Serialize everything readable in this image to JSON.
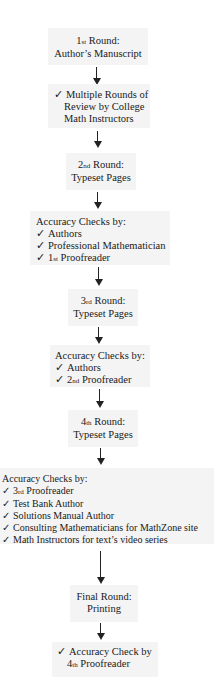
{
  "diagram": {
    "nodes": [
      {
        "id": "round1",
        "lines": [
          {
            "ord_num": "1",
            "ord_sfx": "st",
            "text": " Round:"
          },
          {
            "text": "Author’s Manuscript"
          }
        ]
      },
      {
        "id": "review",
        "lines": [
          {
            "check": "✓",
            "text": "Multiple Rounds of"
          },
          {
            "text": "Review by College"
          },
          {
            "text": "Math Instructors"
          }
        ]
      },
      {
        "id": "round2",
        "lines": [
          {
            "ord_num": "2",
            "ord_sfx": "nd",
            "text": " Round:"
          },
          {
            "text": "Typeset Pages"
          }
        ]
      },
      {
        "id": "checks2",
        "heading": "Accuracy Checks by:",
        "items": [
          "Authors",
          "Professional Mathematician",
          "1st Proofreader"
        ]
      },
      {
        "id": "round3",
        "lines": [
          {
            "ord_num": "3",
            "ord_sfx": "rd",
            "text": " Round:"
          },
          {
            "text": "Typeset Pages"
          }
        ]
      },
      {
        "id": "checks3",
        "heading": "Accuracy Checks by:",
        "items": [
          "Authors",
          "2nd Proofreader"
        ]
      },
      {
        "id": "round4",
        "lines": [
          {
            "ord_num": "4",
            "ord_sfx": "th",
            "text": " Round:"
          },
          {
            "text": "Typeset Pages"
          }
        ]
      },
      {
        "id": "checks4",
        "heading": "Accuracy Checks by:",
        "items": [
          "3rd Proofreader",
          "Test Bank Author",
          "Solutions Manual Author",
          "Consulting Mathematicians for MathZone site",
          "Math Instructors for text’s video series"
        ]
      },
      {
        "id": "final",
        "lines": [
          {
            "text": "Final Round:"
          },
          {
            "text": "Printing"
          }
        ]
      },
      {
        "id": "check_final",
        "lines": [
          {
            "check": "✓",
            "text": "Accuracy Check by"
          },
          {
            "text": "4th Proofreader"
          }
        ]
      }
    ],
    "check_glyph": "✓",
    "labels": {
      "r1_a_num": "1",
      "r1_a_sfx": "st",
      "r1_a_rest": " Round:",
      "r1_b": "Author’s Manuscript",
      "rev_a": "Multiple Rounds of",
      "rev_b": "Review by College",
      "rev_c": "Math Instructors",
      "r2_a_num": "2",
      "r2_a_sfx": "nd",
      "r2_a_rest": " Round:",
      "r2_b": "Typeset Pages",
      "c2_h": "Accuracy Checks by:",
      "c2_1": "Authors",
      "c2_2": "Professional Mathematician",
      "c2_3_num": "1",
      "c2_3_sfx": "st",
      "c2_3_rest": " Proofreader",
      "r3_a_num": "3",
      "r3_a_sfx": "rd",
      "r3_a_rest": " Round:",
      "r3_b": "Typeset Pages",
      "c3_h": "Accuracy Checks by:",
      "c3_1": "Authors",
      "c3_2_num": "2",
      "c3_2_sfx": "nd",
      "c3_2_rest": " Proofreader",
      "r4_a_num": "4",
      "r4_a_sfx": "th",
      "r4_a_rest": " Round:",
      "r4_b": "Typeset Pages",
      "c4_h": "Accuracy Checks by:",
      "c4_1_num": "3",
      "c4_1_sfx": "rd",
      "c4_1_rest": " Proofreader",
      "c4_2": "Test Bank Author",
      "c4_3": "Solutions Manual Author",
      "c4_4": "Consulting Mathematicians for MathZone site",
      "c4_5": "Math Instructors for text’s video series",
      "fin_a": "Final Round:",
      "fin_b": "Printing",
      "cf_a": "Accuracy Check by",
      "cf_b_num": "4",
      "cf_b_sfx": "th",
      "cf_b_rest": " Proofreader"
    }
  }
}
